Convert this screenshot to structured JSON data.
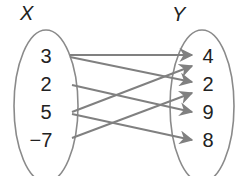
{
  "diagram": {
    "type": "mapping-diagram",
    "domain_label": "X",
    "range_label": "Y",
    "domain_values": [
      "3",
      "2",
      "5",
      "−7"
    ],
    "range_values": [
      "4",
      "2",
      "9",
      "8"
    ],
    "mappings": [
      {
        "from": "3",
        "to": "4"
      },
      {
        "from": "3",
        "to": "2"
      },
      {
        "from": "2",
        "to": "9"
      },
      {
        "from": "5",
        "to": "4"
      },
      {
        "from": "5",
        "to": "8"
      },
      {
        "from": "−7",
        "to": "2"
      }
    ],
    "colors": {
      "ellipse": "#8a8a8a",
      "arrow": "#808080",
      "text": "#222222"
    }
  }
}
